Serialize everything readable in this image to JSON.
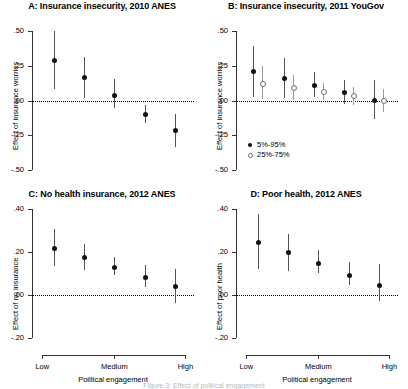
{
  "figure": {
    "caption_partial": "Figure 3: Effect of political engagement"
  },
  "axis_common": {
    "xlabel": "Political engagement",
    "xticks": [
      "Low",
      "Medium",
      "High"
    ],
    "legend": [
      {
        "label": "5%-95%",
        "marker": "filled"
      },
      {
        "label": "25%-75%",
        "marker": "hollow"
      }
    ]
  },
  "chart_data": [
    {
      "type": "scatter",
      "panel": "A",
      "title": "A: Insurance insecurity, 2010 ANES",
      "xlabel": "",
      "ylabel": "Effect of insurance worries",
      "ylim": [
        -0.5,
        0.5
      ],
      "yticks": [
        0.5,
        0.25,
        0.0,
        -0.25,
        -0.5
      ],
      "yticklabels": [
        ".50",
        ".25",
        ".00",
        "-.25",
        "-.50"
      ],
      "xticklabels": [],
      "grid": false,
      "zero_reference_line": 0.0,
      "x": [
        1,
        2,
        3,
        4,
        5
      ],
      "series": [
        {
          "name": "5%-95%",
          "marker": "filled",
          "values": [
            0.29,
            0.17,
            0.04,
            -0.1,
            -0.21
          ],
          "ci_low": [
            0.085,
            0.015,
            -0.055,
            -0.165,
            -0.335
          ],
          "ci_high": [
            0.5,
            0.315,
            0.155,
            -0.035,
            -0.095
          ]
        }
      ]
    },
    {
      "type": "scatter",
      "panel": "B",
      "title": "B: Insurance insecurity, 2011 YouGov",
      "xlabel": "",
      "ylabel": "Effect of insurance worries",
      "ylim": [
        -0.5,
        0.5
      ],
      "yticks": [
        0.5,
        0.25,
        0.0,
        -0.25,
        -0.5
      ],
      "yticklabels": [
        ".50",
        ".25",
        ".00",
        "-.25",
        "-.50"
      ],
      "xticklabels": [],
      "grid": false,
      "zero_reference_line": 0.0,
      "x": [
        1,
        2,
        3,
        4,
        5
      ],
      "series": [
        {
          "name": "5%-95%",
          "marker": "filled",
          "values": [
            0.21,
            0.16,
            0.11,
            0.06,
            0.005
          ],
          "ci_low": [
            0.025,
            0.015,
            0.025,
            -0.025,
            -0.135
          ],
          "ci_high": [
            0.395,
            0.305,
            0.205,
            0.145,
            0.145
          ]
        },
        {
          "name": "25%-75%",
          "marker": "hollow",
          "values": [
            0.12,
            0.09,
            0.06,
            0.03,
            0.0
          ],
          "ci_low": [
            0.01,
            0.005,
            0.005,
            -0.03,
            -0.085
          ],
          "ci_high": [
            0.245,
            0.185,
            0.125,
            0.095,
            0.085
          ]
        }
      ]
    },
    {
      "type": "scatter",
      "panel": "C",
      "title": "C: No health insurance, 2012 ANES",
      "xlabel": "Political engagement",
      "ylabel": "Effect of no insurance",
      "ylim": [
        -0.2,
        0.4
      ],
      "yticks": [
        0.4,
        0.2,
        0.0,
        -0.2
      ],
      "yticklabels": [
        ".40",
        ".20",
        ".00",
        "-.20"
      ],
      "xticklabels": [
        "Low",
        "Medium",
        "High"
      ],
      "grid": false,
      "zero_reference_line": 0.0,
      "x": [
        1,
        2,
        3,
        4,
        5
      ],
      "series": [
        {
          "name": "5%-95%",
          "marker": "filled",
          "values": [
            0.22,
            0.175,
            0.13,
            0.085,
            0.04
          ],
          "ci_low": [
            0.135,
            0.115,
            0.095,
            0.035,
            -0.035
          ],
          "ci_high": [
            0.305,
            0.235,
            0.175,
            0.14,
            0.12
          ]
        }
      ]
    },
    {
      "type": "scatter",
      "panel": "D",
      "title": "D: Poor health, 2012 ANES",
      "xlabel": "Political engagement",
      "ylabel": "Effect of poor health",
      "ylim": [
        -0.2,
        0.4
      ],
      "yticks": [
        0.4,
        0.2,
        0.0,
        -0.2
      ],
      "yticklabels": [
        ".40",
        ".20",
        ".00",
        "-.20"
      ],
      "xticklabels": [
        "Low",
        "Medium",
        "High"
      ],
      "grid": false,
      "zero_reference_line": 0.0,
      "x": [
        1,
        2,
        3,
        4,
        5
      ],
      "series": [
        {
          "name": "5%-95%",
          "marker": "filled",
          "values": [
            0.245,
            0.2,
            0.15,
            0.095,
            0.045
          ],
          "ci_low": [
            0.12,
            0.11,
            0.1,
            0.045,
            -0.03
          ],
          "ci_high": [
            0.375,
            0.285,
            0.21,
            0.155,
            0.145
          ]
        }
      ]
    }
  ]
}
